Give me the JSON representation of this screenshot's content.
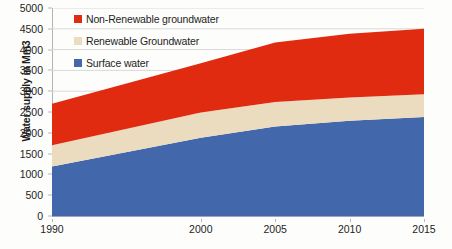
{
  "chart_data": {
    "type": "area",
    "stacked": true,
    "title": "",
    "xlabel": "",
    "ylabel": "Water supply in Mm3",
    "x": [
      1990,
      2000,
      2005,
      2010,
      2015
    ],
    "categories": [
      "1990",
      "2000",
      "2005",
      "2010",
      "2015"
    ],
    "xtick_labels": [
      "1990",
      "2000",
      "2005",
      "2010",
      "2015"
    ],
    "ytick_labels": [
      "0",
      "500",
      "1000",
      "1500",
      "2000",
      "2500",
      "3000",
      "3500",
      "4000",
      "4500",
      "5000"
    ],
    "ylim": [
      0,
      5000
    ],
    "xlim": [
      1990,
      2015
    ],
    "ytick_step": 500,
    "grid": "horizontal",
    "legend_position": "top-left-inside",
    "series": [
      {
        "name": "Surface water",
        "color": "#4267AA",
        "values": [
          1190,
          1880,
          2150,
          2290,
          2380
        ]
      },
      {
        "name": "Renewable Groundwater",
        "color": "#EBDCC0",
        "values": [
          510,
          610,
          590,
          560,
          545
        ]
      },
      {
        "name": "Non-Renewable groundwater",
        "color": "#E02B10",
        "values": [
          1000,
          1180,
          1430,
          1530,
          1575
        ]
      }
    ],
    "cumulative_totals": [
      2700,
      3670,
      4170,
      4380,
      4500
    ],
    "series_order_legend": [
      "Non-Renewable groundwater",
      "Renewable Groundwater",
      "Surface water"
    ]
  },
  "legend": {
    "items": [
      {
        "label": "Non-Renewable groundwater",
        "color": "#E02B10"
      },
      {
        "label": "Renewable Groundwater",
        "color": "#EBDCC0"
      },
      {
        "label": "Surface water",
        "color": "#4267AA"
      }
    ]
  },
  "axes": {
    "y_title": "Water supply in Mm3"
  },
  "colors": {
    "gridline": "#d9d9d9",
    "axis": "#b3b3b3",
    "text": "#1d1d1d",
    "background": "#fdfdfc"
  }
}
